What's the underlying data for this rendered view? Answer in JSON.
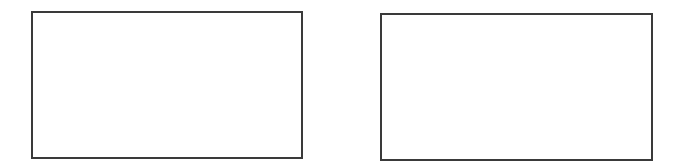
{
  "canvas": {
    "width": 677,
    "height": 165,
    "background": "#ffffff"
  },
  "panels": [
    {
      "id": "left",
      "border_color": "#3a3a3a",
      "fill": "#ffffff",
      "content": ""
    },
    {
      "id": "right",
      "border_color": "#3a3a3a",
      "fill": "#ffffff",
      "content": ""
    }
  ]
}
